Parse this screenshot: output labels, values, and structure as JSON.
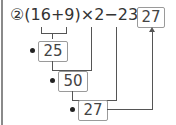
{
  "problem": {
    "number_symbol": "②",
    "expression": "(16+9)×2−23=",
    "final_answer": "27"
  },
  "steps": [
    {
      "marker": "❶",
      "value": "25"
    },
    {
      "marker": "❷",
      "value": "50"
    },
    {
      "marker": "❸",
      "value": "27"
    }
  ],
  "colors": {
    "line": "#555555",
    "box_border": "#9a9a9a",
    "edge": "#8a8a8a"
  }
}
